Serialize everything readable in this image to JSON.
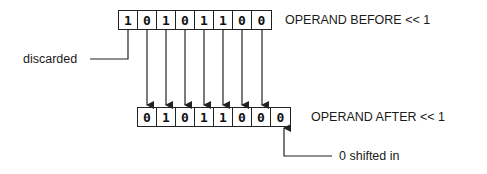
{
  "diagram": {
    "before": {
      "label": "OPERAND BEFORE << 1",
      "bits": [
        "1",
        "0",
        "1",
        "0",
        "1",
        "1",
        "0",
        "0"
      ]
    },
    "after": {
      "label": "OPERAND AFTER << 1",
      "bits": [
        "0",
        "1",
        "0",
        "1",
        "1",
        "0",
        "0",
        "0"
      ]
    },
    "annotations": {
      "discarded": "discarded",
      "shifted_in": "0 shifted in"
    },
    "colors": {
      "line": "#222222",
      "text": "#1a1a1a",
      "background": "#ffffff"
    }
  }
}
